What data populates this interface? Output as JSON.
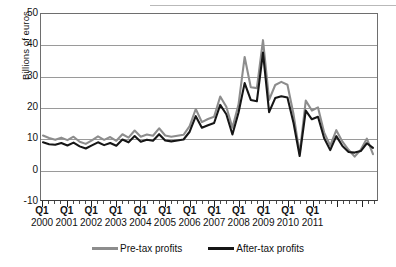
{
  "axes": {
    "y_axis_label": "Billions of euros",
    "y_ticks": [
      "50",
      "40",
      "30",
      "20",
      "10",
      "0",
      "-10"
    ],
    "x_quarter_label": "Q1",
    "x_years": [
      "2000",
      "2001",
      "2002",
      "2003",
      "2004",
      "2005",
      "2006",
      "2007",
      "2008",
      "2009",
      "2010",
      "2011"
    ]
  },
  "legend": {
    "pre_tax_label": "Pre-tax profits",
    "after_tax_label": "After-tax profits",
    "pre_tax_color": "#8d8d8d",
    "after_tax_color": "#161616"
  },
  "chart_data": {
    "type": "line",
    "title": "",
    "xlabel": "",
    "ylabel": "Billions of euros",
    "ylim": [
      -10,
      50
    ],
    "yticks": [
      -10,
      0,
      10,
      20,
      30,
      40,
      50
    ],
    "grid": true,
    "legend_position": "bottom",
    "x": [
      "Q1 2000",
      "Q2 2000",
      "Q3 2000",
      "Q4 2000",
      "Q1 2001",
      "Q2 2001",
      "Q3 2001",
      "Q4 2001",
      "Q1 2002",
      "Q2 2002",
      "Q3 2002",
      "Q4 2002",
      "Q1 2003",
      "Q2 2003",
      "Q3 2003",
      "Q4 2003",
      "Q1 2004",
      "Q2 2004",
      "Q3 2004",
      "Q4 2004",
      "Q1 2005",
      "Q2 2005",
      "Q3 2005",
      "Q4 2005",
      "Q1 2006",
      "Q2 2006",
      "Q3 2006",
      "Q4 2006",
      "Q1 2007",
      "Q2 2007",
      "Q3 2007",
      "Q4 2007",
      "Q1 2008",
      "Q2 2008",
      "Q3 2008",
      "Q4 2008",
      "Q1 2009",
      "Q2 2009",
      "Q3 2009",
      "Q4 2009",
      "Q1 2010",
      "Q2 2010",
      "Q3 2010",
      "Q4 2010",
      "Q1 2011",
      "Q2 2011"
    ],
    "series": [
      {
        "name": "Pre-tax profits",
        "color": "#8d8d8d",
        "values": [
          11.0,
          10.2,
          9.6,
          10.3,
          9.5,
          10.6,
          9.0,
          8.3,
          9.4,
          10.7,
          9.6,
          10.5,
          9.3,
          11.4,
          10.3,
          12.6,
          10.6,
          11.3,
          10.9,
          13.3,
          11.0,
          10.6,
          10.9,
          11.2,
          14.0,
          19.5,
          15.3,
          16.3,
          17.0,
          23.5,
          20.2,
          13.5,
          21.0,
          36.2,
          26.5,
          26.2,
          41.6,
          22.4,
          27.2,
          28.2,
          27.3,
          17.8,
          5.2,
          22.2,
          19.0,
          20.0
        ]
      },
      {
        "name": "After-tax profits",
        "color": "#161616",
        "values": [
          8.8,
          8.2,
          8.0,
          8.6,
          7.8,
          8.7,
          7.5,
          6.8,
          7.8,
          8.8,
          7.9,
          8.6,
          7.7,
          9.7,
          8.8,
          10.8,
          9.0,
          9.6,
          9.3,
          11.4,
          9.4,
          9.1,
          9.4,
          9.7,
          12.2,
          17.2,
          13.5,
          14.3,
          15.0,
          20.8,
          17.8,
          11.3,
          18.4,
          27.8,
          22.4,
          22.0,
          37.6,
          18.5,
          23.0,
          23.6,
          23.2,
          15.0,
          4.4,
          19.0,
          16.2,
          17.0
        ]
      }
    ],
    "note_tail": {
      "pre_tax_tail": [
        12.0,
        7.7,
        12.7,
        9.0,
        6.4,
        4.2,
        6.4,
        10.0,
        5.0
      ],
      "after_tax_tail": [
        10.2,
        6.3,
        10.8,
        7.6,
        5.7,
        5.5,
        6.0,
        8.5,
        7.0
      ]
    }
  }
}
